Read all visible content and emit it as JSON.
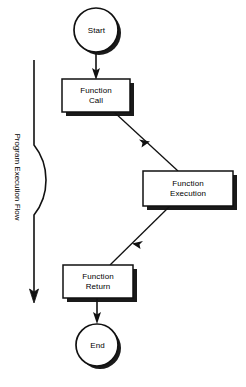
{
  "diagram": {
    "title": "Program Execution Flow",
    "type": "flowchart",
    "axis_label": "Program Execution Flow",
    "colors": {
      "stroke": "#111111",
      "fill": "#ffffff",
      "shadow": "#1a1a1a",
      "text": "#000000"
    },
    "nodes": [
      {
        "id": "start",
        "label": "Start",
        "shape": "circle",
        "cx": 96,
        "cy": 30,
        "r": 22
      },
      {
        "id": "function-call",
        "label": "Function\nCall",
        "shape": "rect",
        "x": 62,
        "y": 79,
        "w": 68,
        "h": 33
      },
      {
        "id": "function-execution",
        "label": "Function\nExecution",
        "shape": "rect",
        "x": 143,
        "y": 171,
        "w": 90,
        "h": 35
      },
      {
        "id": "function-return",
        "label": "Function\nReturn",
        "shape": "rect",
        "x": 63,
        "y": 265,
        "w": 70,
        "h": 33
      },
      {
        "id": "end",
        "label": "End",
        "shape": "circle",
        "cx": 97,
        "cy": 345,
        "r": 21
      }
    ],
    "edges": [
      {
        "id": "start-to-call",
        "from": "start",
        "to": "function-call",
        "style": "straight-vertical"
      },
      {
        "id": "call-to-execution",
        "from": "function-call",
        "to": "function-execution",
        "style": "diagonal"
      },
      {
        "id": "execution-to-return",
        "from": "function-execution",
        "to": "function-return",
        "style": "diagonal"
      },
      {
        "id": "return-to-end",
        "from": "function-return",
        "to": "end",
        "style": "straight-vertical"
      }
    ],
    "flow_arrow": {
      "id": "program-execution-flow-arrow",
      "description": "curved vertical arrow pointing downward",
      "x": 34,
      "y_top": 60,
      "y_bottom": 301
    }
  }
}
